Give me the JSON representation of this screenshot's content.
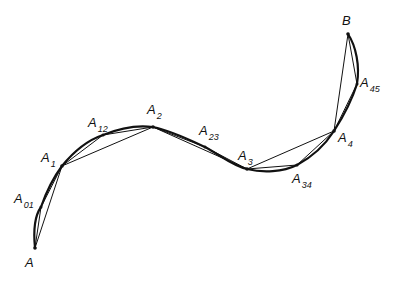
{
  "diagram": {
    "colors": {
      "stroke": "#111111",
      "background": "#ffffff"
    },
    "points": [
      {
        "id": "A",
        "base": "A",
        "sub": "",
        "x": 35,
        "y": 248,
        "label_x": 25,
        "label_y": 256
      },
      {
        "id": "A01",
        "base": "A",
        "sub": "01",
        "x": 41,
        "y": 207,
        "label_x": 14,
        "label_y": 192
      },
      {
        "id": "A1",
        "base": "A",
        "sub": "1",
        "x": 62,
        "y": 166,
        "label_x": 41,
        "label_y": 151
      },
      {
        "id": "A12",
        "base": "A",
        "sub": "12",
        "x": 103,
        "y": 135,
        "label_x": 88,
        "label_y": 116
      },
      {
        "id": "A2",
        "base": "A",
        "sub": "2",
        "x": 153,
        "y": 127,
        "label_x": 147,
        "label_y": 103
      },
      {
        "id": "A23",
        "base": "A",
        "sub": "23",
        "x": 205,
        "y": 147,
        "label_x": 199,
        "label_y": 124
      },
      {
        "id": "A3",
        "base": "A",
        "sub": "3",
        "x": 247,
        "y": 169,
        "label_x": 238,
        "label_y": 149
      },
      {
        "id": "A34",
        "base": "A",
        "sub": "34",
        "x": 297,
        "y": 165,
        "label_x": 292,
        "label_y": 172
      },
      {
        "id": "A4",
        "base": "A",
        "sub": "4",
        "x": 334,
        "y": 131,
        "label_x": 338,
        "label_y": 131
      },
      {
        "id": "A45",
        "base": "A",
        "sub": "45",
        "x": 357,
        "y": 84,
        "label_x": 360,
        "label_y": 76
      },
      {
        "id": "B",
        "base": "B",
        "sub": "",
        "x": 348,
        "y": 34,
        "label_x": 342,
        "label_y": 14
      }
    ]
  }
}
